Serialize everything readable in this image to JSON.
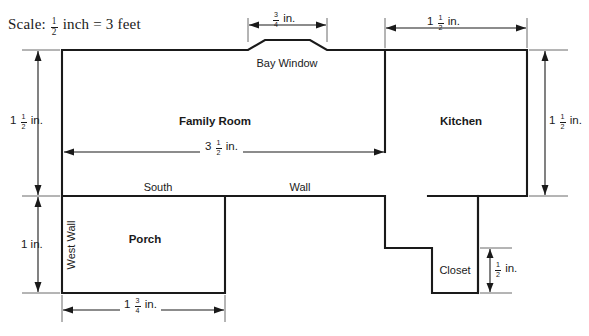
{
  "diagram": {
    "scale_note": {
      "prefix": "Scale:",
      "fraction_numerator": "1",
      "fraction_denominator": "2",
      "middle": "inch",
      "equals": "=",
      "value": "3 feet"
    },
    "rooms": [
      {
        "id": "family-room",
        "label": "Family Room",
        "bold": true
      },
      {
        "id": "kitchen",
        "label": "Kitchen",
        "bold": true
      },
      {
        "id": "porch",
        "label": "Porch",
        "bold": true
      },
      {
        "id": "closet",
        "label": "Closet",
        "bold": false
      },
      {
        "id": "bay-window",
        "label": "Bay Window",
        "bold": false
      }
    ],
    "wall_labels": [
      {
        "id": "south-wall-south",
        "label": "South"
      },
      {
        "id": "south-wall-wall",
        "label": "Wall"
      },
      {
        "id": "west-wall",
        "label": "West Wall",
        "rotated": true
      }
    ],
    "dimensions": [
      {
        "id": "bay-window-width",
        "whole": "",
        "numerator": "3",
        "denominator": "4",
        "unit": "in.",
        "orientation": "horizontal",
        "text": "3/4 in."
      },
      {
        "id": "kitchen-width",
        "whole": "1",
        "numerator": "1",
        "denominator": "2",
        "unit": "in.",
        "orientation": "horizontal",
        "text": "1 1/2 in."
      },
      {
        "id": "family-room-height-left",
        "whole": "1",
        "numerator": "1",
        "denominator": "2",
        "unit": "in.",
        "orientation": "vertical",
        "text": "1 1/2 in."
      },
      {
        "id": "porch-height-left",
        "whole": "1",
        "numerator": "",
        "denominator": "",
        "unit": "in.",
        "orientation": "vertical",
        "text": "1 in."
      },
      {
        "id": "house-width-interior",
        "whole": "3",
        "numerator": "1",
        "denominator": "2",
        "unit": "in.",
        "orientation": "horizontal",
        "text": "3 1/2 in."
      },
      {
        "id": "kitchen-height-right",
        "whole": "1",
        "numerator": "1",
        "denominator": "2",
        "unit": "in.",
        "orientation": "vertical",
        "text": "1 1/2 in."
      },
      {
        "id": "closet-height",
        "whole": "",
        "numerator": "1",
        "denominator": "2",
        "unit": "in.",
        "orientation": "vertical",
        "text": "1/2 in."
      },
      {
        "id": "porch-width-bottom",
        "whole": "1",
        "numerator": "3",
        "denominator": "4",
        "unit": "in.",
        "orientation": "horizontal",
        "text": "1 3/4 in."
      }
    ],
    "colors": {
      "wall": "#1a1a1a",
      "dimension": "#1a1a1a",
      "extension": "#5a5a5a",
      "background": "#ffffff"
    }
  }
}
